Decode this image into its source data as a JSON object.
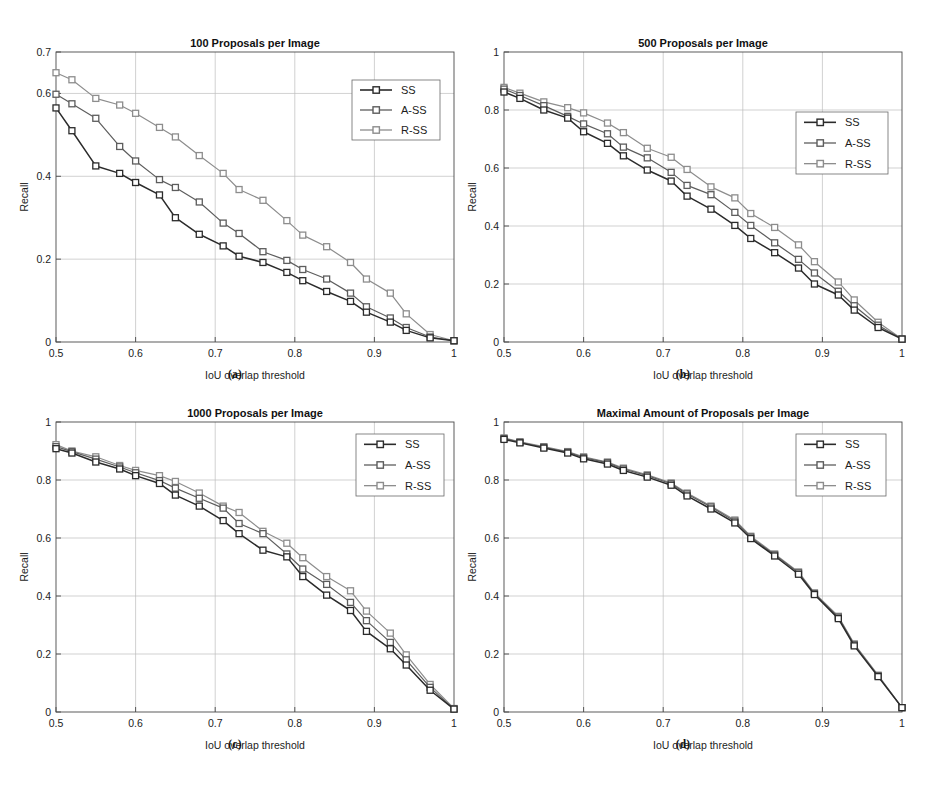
{
  "figure": {
    "background": "#ffffff",
    "series_colors": {
      "SS": "#2b2b2b",
      "A-SS": "#5d5d5d",
      "R-SS": "#8d8d8d"
    },
    "marker": "square",
    "legend_position": "north-east",
    "grid": true,
    "subcaptions": {
      "a": "(a)",
      "b": "(b)",
      "c": "(c)",
      "d": "(d)"
    },
    "axis_titles": {
      "x": "IoU overlap threshold",
      "y": "Recall"
    },
    "legend_labels": [
      "SS",
      "A-SS",
      "R-SS"
    ]
  },
  "chart_data": [
    {
      "type": "line",
      "panel": "a",
      "title": "100 Proposals per Image",
      "xlabel": "IoU overlap threshold",
      "ylabel": "Recall",
      "xlim": [
        0.5,
        1.0
      ],
      "ylim": [
        0.0,
        0.7
      ],
      "xticks": [
        0.5,
        0.6,
        0.7,
        0.8,
        0.9,
        1.0
      ],
      "xticklabels": [
        "0.5",
        "0.6",
        "0.7",
        "0.8",
        "0.9",
        "1"
      ],
      "yticks": [
        0.0,
        0.2,
        0.4,
        0.6,
        0.7
      ],
      "yticklabels": [
        "0",
        "0.2",
        "0.4",
        "0.6",
        "0.7"
      ],
      "grid": true,
      "legend": [
        "SS",
        "A-SS",
        "R-SS"
      ],
      "x": [
        0.5,
        0.52,
        0.55,
        0.58,
        0.6,
        0.63,
        0.65,
        0.68,
        0.71,
        0.73,
        0.76,
        0.79,
        0.81,
        0.84,
        0.87,
        0.89,
        0.92,
        0.94,
        0.97,
        1.0
      ],
      "series": [
        {
          "name": "SS",
          "values": [
            0.565,
            0.51,
            0.425,
            0.407,
            0.385,
            0.355,
            0.3,
            0.26,
            0.232,
            0.207,
            0.192,
            0.168,
            0.148,
            0.122,
            0.098,
            0.072,
            0.048,
            0.028,
            0.01,
            0.003
          ]
        },
        {
          "name": "A-SS",
          "values": [
            0.598,
            0.575,
            0.54,
            0.472,
            0.437,
            0.392,
            0.373,
            0.338,
            0.287,
            0.262,
            0.218,
            0.197,
            0.175,
            0.152,
            0.118,
            0.085,
            0.058,
            0.035,
            0.012,
            0.003
          ]
        },
        {
          "name": "R-SS",
          "values": [
            0.65,
            0.633,
            0.588,
            0.572,
            0.552,
            0.518,
            0.495,
            0.45,
            0.407,
            0.368,
            0.342,
            0.293,
            0.258,
            0.23,
            0.192,
            0.152,
            0.118,
            0.068,
            0.018,
            0.003
          ]
        }
      ]
    },
    {
      "type": "line",
      "panel": "b",
      "title": "500 Proposals per Image",
      "xlabel": "IoU overlap threshold",
      "ylabel": "Recall",
      "xlim": [
        0.5,
        1.0
      ],
      "ylim": [
        0.0,
        1.0
      ],
      "xticks": [
        0.5,
        0.6,
        0.7,
        0.8,
        0.9,
        1.0
      ],
      "xticklabels": [
        "0.5",
        "0.6",
        "0.7",
        "0.8",
        "0.9",
        "1"
      ],
      "yticks": [
        0.0,
        0.2,
        0.4,
        0.6,
        0.8,
        1.0
      ],
      "yticklabels": [
        "0",
        "0.2",
        "0.4",
        "0.6",
        "0.8",
        "1"
      ],
      "grid": true,
      "legend": [
        "SS",
        "A-SS",
        "R-SS"
      ],
      "x": [
        0.5,
        0.52,
        0.55,
        0.58,
        0.6,
        0.63,
        0.65,
        0.68,
        0.71,
        0.73,
        0.76,
        0.79,
        0.81,
        0.84,
        0.87,
        0.89,
        0.92,
        0.94,
        0.97,
        1.0
      ],
      "series": [
        {
          "name": "SS",
          "values": [
            0.862,
            0.84,
            0.8,
            0.772,
            0.725,
            0.685,
            0.642,
            0.593,
            0.555,
            0.503,
            0.458,
            0.402,
            0.357,
            0.308,
            0.255,
            0.2,
            0.162,
            0.11,
            0.05,
            0.01
          ]
        },
        {
          "name": "A-SS",
          "values": [
            0.872,
            0.85,
            0.815,
            0.778,
            0.752,
            0.718,
            0.672,
            0.635,
            0.585,
            0.54,
            0.508,
            0.447,
            0.402,
            0.342,
            0.285,
            0.238,
            0.175,
            0.125,
            0.058,
            0.01
          ]
        },
        {
          "name": "R-SS",
          "values": [
            0.878,
            0.858,
            0.828,
            0.808,
            0.79,
            0.755,
            0.722,
            0.668,
            0.637,
            0.595,
            0.535,
            0.497,
            0.443,
            0.395,
            0.335,
            0.277,
            0.207,
            0.145,
            0.068,
            0.01
          ]
        }
      ]
    },
    {
      "type": "line",
      "panel": "c",
      "title": "1000 Proposals per Image",
      "xlabel": "IoU overlap threshold",
      "ylabel": "Recall",
      "xlim": [
        0.5,
        1.0
      ],
      "ylim": [
        0.0,
        1.0
      ],
      "xticks": [
        0.5,
        0.6,
        0.7,
        0.8,
        0.9,
        1.0
      ],
      "xticklabels": [
        "0.5",
        "0.6",
        "0.7",
        "0.8",
        "0.9",
        "1"
      ],
      "yticks": [
        0.0,
        0.2,
        0.4,
        0.6,
        0.8,
        1.0
      ],
      "yticklabels": [
        "0",
        "0.2",
        "0.4",
        "0.6",
        "0.8",
        "1"
      ],
      "grid": true,
      "legend": [
        "SS",
        "A-SS",
        "R-SS"
      ],
      "x": [
        0.5,
        0.52,
        0.55,
        0.58,
        0.6,
        0.63,
        0.65,
        0.68,
        0.71,
        0.73,
        0.76,
        0.79,
        0.81,
        0.84,
        0.87,
        0.89,
        0.92,
        0.94,
        0.97,
        1.0
      ],
      "series": [
        {
          "name": "SS",
          "values": [
            0.908,
            0.893,
            0.862,
            0.838,
            0.815,
            0.788,
            0.748,
            0.71,
            0.66,
            0.615,
            0.558,
            0.535,
            0.467,
            0.403,
            0.35,
            0.278,
            0.218,
            0.162,
            0.075,
            0.01
          ]
        },
        {
          "name": "A-SS",
          "values": [
            0.915,
            0.898,
            0.872,
            0.845,
            0.825,
            0.798,
            0.772,
            0.737,
            0.703,
            0.65,
            0.615,
            0.545,
            0.493,
            0.44,
            0.378,
            0.315,
            0.24,
            0.18,
            0.085,
            0.01
          ]
        },
        {
          "name": "R-SS",
          "values": [
            0.922,
            0.9,
            0.88,
            0.85,
            0.833,
            0.815,
            0.795,
            0.755,
            0.71,
            0.688,
            0.623,
            0.582,
            0.532,
            0.467,
            0.418,
            0.348,
            0.272,
            0.197,
            0.095,
            0.012
          ]
        }
      ]
    },
    {
      "type": "line",
      "panel": "d",
      "title": "Maximal Amount of Proposals per Image",
      "xlabel": "IoU overlap threshold",
      "ylabel": "Recall",
      "xlim": [
        0.5,
        1.0
      ],
      "ylim": [
        0.0,
        1.0
      ],
      "xticks": [
        0.5,
        0.6,
        0.7,
        0.8,
        0.9,
        1.0
      ],
      "xticklabels": [
        "0.5",
        "0.6",
        "0.7",
        "0.8",
        "0.9",
        "1"
      ],
      "yticks": [
        0.0,
        0.2,
        0.4,
        0.6,
        0.8,
        1.0
      ],
      "yticklabels": [
        "0",
        "0.2",
        "0.4",
        "0.6",
        "0.8",
        "1"
      ],
      "grid": true,
      "legend": [
        "SS",
        "A-SS",
        "R-SS"
      ],
      "x": [
        0.5,
        0.52,
        0.55,
        0.58,
        0.6,
        0.63,
        0.65,
        0.68,
        0.71,
        0.73,
        0.76,
        0.79,
        0.81,
        0.84,
        0.87,
        0.89,
        0.92,
        0.94,
        0.97,
        1.0
      ],
      "series": [
        {
          "name": "SS",
          "values": [
            0.94,
            0.928,
            0.91,
            0.893,
            0.873,
            0.855,
            0.833,
            0.81,
            0.782,
            0.745,
            0.7,
            0.652,
            0.598,
            0.538,
            0.475,
            0.405,
            0.322,
            0.228,
            0.122,
            0.015
          ]
        },
        {
          "name": "A-SS",
          "values": [
            0.943,
            0.93,
            0.913,
            0.896,
            0.877,
            0.86,
            0.838,
            0.815,
            0.787,
            0.752,
            0.707,
            0.658,
            0.603,
            0.542,
            0.48,
            0.408,
            0.327,
            0.232,
            0.125,
            0.015
          ]
        },
        {
          "name": "R-SS",
          "values": [
            0.945,
            0.932,
            0.915,
            0.898,
            0.88,
            0.862,
            0.841,
            0.818,
            0.79,
            0.755,
            0.71,
            0.662,
            0.606,
            0.545,
            0.483,
            0.411,
            0.33,
            0.235,
            0.127,
            0.015
          ]
        }
      ]
    }
  ]
}
